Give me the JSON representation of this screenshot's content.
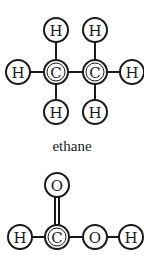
{
  "molecules": [
    {
      "name": "ethane",
      "caption": "ethane",
      "atoms": [
        {
          "id": "h1",
          "symbol": "H",
          "x": 56,
          "y": 30
        },
        {
          "id": "h2",
          "symbol": "H",
          "x": 95,
          "y": 30
        },
        {
          "id": "h3",
          "symbol": "H",
          "x": 18,
          "y": 72
        },
        {
          "id": "c1",
          "symbol": "C",
          "x": 56,
          "y": 72,
          "double_ring": true
        },
        {
          "id": "c2",
          "symbol": "C",
          "x": 95,
          "y": 72,
          "double_ring": true
        },
        {
          "id": "h4",
          "symbol": "H",
          "x": 132,
          "y": 72
        },
        {
          "id": "h5",
          "symbol": "H",
          "x": 56,
          "y": 112
        },
        {
          "id": "h6",
          "symbol": "H",
          "x": 95,
          "y": 112
        }
      ],
      "bonds": [
        {
          "from": "h1",
          "to": "c1",
          "order": 1
        },
        {
          "from": "h2",
          "to": "c2",
          "order": 1
        },
        {
          "from": "h3",
          "to": "c1",
          "order": 1
        },
        {
          "from": "c1",
          "to": "c2",
          "order": 1
        },
        {
          "from": "c2",
          "to": "h4",
          "order": 1
        },
        {
          "from": "c1",
          "to": "h5",
          "order": 1
        },
        {
          "from": "c2",
          "to": "h6",
          "order": 1
        }
      ]
    },
    {
      "name": "formic-acid",
      "caption": "",
      "atoms": [
        {
          "id": "o1",
          "symbol": "O",
          "x": 57,
          "y": 185
        },
        {
          "id": "h7",
          "symbol": "H",
          "x": 20,
          "y": 237
        },
        {
          "id": "c3",
          "symbol": "C",
          "x": 57,
          "y": 237,
          "double_ring": true
        },
        {
          "id": "o2",
          "symbol": "O",
          "x": 95,
          "y": 237
        },
        {
          "id": "h8",
          "symbol": "H",
          "x": 131,
          "y": 237
        }
      ],
      "bonds": [
        {
          "from": "c3",
          "to": "o1",
          "order": 2
        },
        {
          "from": "h7",
          "to": "c3",
          "order": 1
        },
        {
          "from": "c3",
          "to": "o2",
          "order": 1
        },
        {
          "from": "o2",
          "to": "h8",
          "order": 1
        }
      ]
    }
  ],
  "style": {
    "stroke": "#1a1a1a",
    "atom_radius": 12
  }
}
